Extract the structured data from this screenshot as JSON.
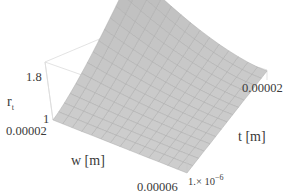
{
  "chart_data": {
    "type": "surface3d",
    "title": "",
    "zlabel": "r_t",
    "xlabel": "w [m]",
    "ylabel": "t [m]",
    "zlabel_main": "r",
    "zlabel_sub": "t",
    "z_ticks": [
      "1",
      "1.8"
    ],
    "w_ticks": [
      "0.00002",
      "0.00006"
    ],
    "t_ticks": [
      "1.× 10",
      "0.00002"
    ],
    "t_tick_exp": "−6",
    "w_range": [
      2e-05,
      6e-05
    ],
    "t_range": [
      1e-06,
      2e-05
    ],
    "z_range": [
      1,
      1.8
    ],
    "surface_description": "r_t rises sharply as both w and t approach small w / large t corner; near 1 for large w and small t",
    "grid": true,
    "surface_color": "#cfcfcf",
    "mesh_color": "#a8a8a8",
    "box_color": "#d6d6d6",
    "samples": [
      {
        "w": 2e-05,
        "t": 2e-05,
        "r": 1.95
      },
      {
        "w": 2e-05,
        "t": 1e-05,
        "r": 1.5
      },
      {
        "w": 2e-05,
        "t": 1e-06,
        "r": 1.05
      },
      {
        "w": 4e-05,
        "t": 2e-05,
        "r": 1.45
      },
      {
        "w": 4e-05,
        "t": 1e-05,
        "r": 1.2
      },
      {
        "w": 6e-05,
        "t": 2e-05,
        "r": 1.25
      },
      {
        "w": 6e-05,
        "t": 1e-06,
        "r": 1.0
      }
    ]
  },
  "labels": {
    "z_axis_main": "r",
    "z_axis_sub": "t",
    "z_tick_top": "1.8",
    "z_tick_bottom": "1",
    "w_tick_left": "0.00002",
    "w_axis": "w [m]",
    "w_tick_right": "0.00006",
    "t_tick_front": "1.× 10",
    "t_tick_front_exp": "−6",
    "t_axis": "t [m]",
    "t_tick_back": "0.00002"
  }
}
